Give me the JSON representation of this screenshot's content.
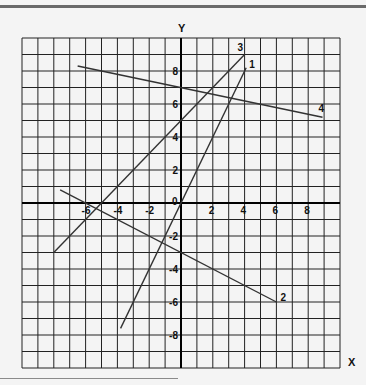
{
  "chart_data": {
    "type": "line",
    "title": "",
    "xlabel": "X",
    "ylabel": "Y",
    "xlim": [
      -10,
      10
    ],
    "ylim": [
      -10,
      10
    ],
    "grid": true,
    "grid_step": 1,
    "x_ticks": [
      -6,
      -4,
      -2,
      2,
      4,
      6,
      8
    ],
    "x_tick_labels": [
      "-6",
      "-4",
      "-2",
      "2",
      "4",
      "6",
      "8"
    ],
    "y_ticks": [
      8,
      6,
      4,
      2,
      -2,
      -4,
      -6,
      -8
    ],
    "y_tick_labels": [
      "8",
      "6",
      "4",
      "2",
      "-2",
      "-4",
      "-6",
      "-8"
    ],
    "origin_label": "0",
    "series": [
      {
        "name": "1",
        "equation": "y = 2x",
        "points": [
          [
            -3.8,
            -7.6
          ],
          [
            4.1,
            8.2
          ]
        ]
      },
      {
        "name": "2",
        "equation": "y = -0.5x - 3",
        "points": [
          [
            -7.6,
            0.8
          ],
          [
            6.0,
            -6.0
          ]
        ]
      },
      {
        "name": "3",
        "equation": "y = x + 5",
        "points": [
          [
            -8.0,
            -3.0
          ],
          [
            4.0,
            9.0
          ]
        ]
      },
      {
        "name": "4",
        "equation": "y = -0.2x + 7",
        "points": [
          [
            -6.5,
            8.3
          ],
          [
            8.9,
            5.2
          ]
        ]
      }
    ]
  },
  "colors": {
    "background": "#f4f4f4",
    "grid": "#222222",
    "line": "#333333",
    "rule": "#6a6a6a"
  }
}
